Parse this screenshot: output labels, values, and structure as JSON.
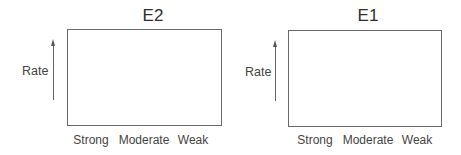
{
  "panels": [
    {
      "title": "E2",
      "ylabel": "Rate",
      "xlabels": [
        "Strong",
        "Moderate",
        "Weak"
      ]
    },
    {
      "title": "E1",
      "ylabel": "Rate",
      "xlabels": [
        "Strong",
        "Moderate",
        "Weak"
      ]
    }
  ]
}
